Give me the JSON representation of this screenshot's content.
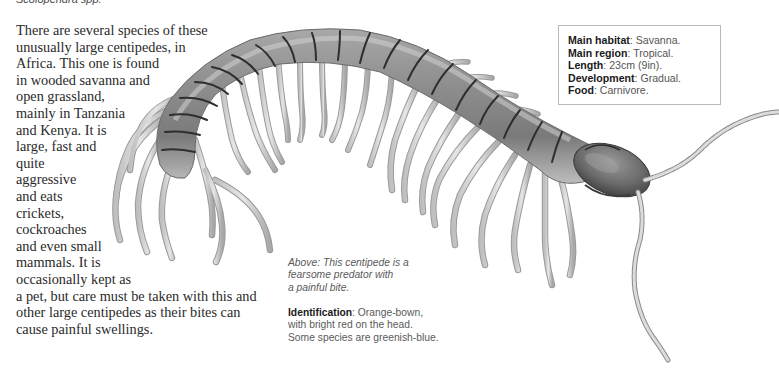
{
  "species": {
    "caption": "Scolopendra spp."
  },
  "description": {
    "lines": [
      "There are several species of these",
      "unusually large centipedes, in",
      "Africa. This one is found",
      "in wooded savanna and",
      "open grassland,",
      "mainly in Tanzania",
      "and Kenya. It is",
      "large, fast and",
      "quite",
      "aggressive",
      "and eats",
      "crickets,",
      "cockroaches",
      "and even small",
      "mammals. It is",
      "occasionally kept as",
      "a pet, but care must be taken with this and",
      "other large centipedes as their bites can",
      "cause painful swellings."
    ]
  },
  "fact_box": {
    "rows": [
      {
        "label": "Main habitat",
        "value": ": Savanna."
      },
      {
        "label": "Main region",
        "value": ": Tropical."
      },
      {
        "label": "Length",
        "value": ": 23cm (9in)."
      },
      {
        "label": "Development",
        "value": ": Gradual."
      },
      {
        "label": "Food",
        "value": ": Carnivore."
      }
    ]
  },
  "photo_caption": {
    "lines": [
      "Above: This centipede is a",
      "fearsome predator with",
      "a painful bite."
    ]
  },
  "identification": {
    "label": "Identification",
    "lines": [
      ": Orange-bown,",
      "with bright red on the head.",
      "Some species are greenish-blue."
    ]
  },
  "illustration": {
    "subject": "centipede-illustration",
    "colors": {
      "body_light": "#c9c9c9",
      "body_mid": "#9a9a9a",
      "body_dark": "#5a5a5a",
      "segment_line": "#2e2e2e",
      "leg": "#d6d6d6",
      "leg_outline": "#8a8a8a",
      "head": "#6e6e6e"
    }
  }
}
